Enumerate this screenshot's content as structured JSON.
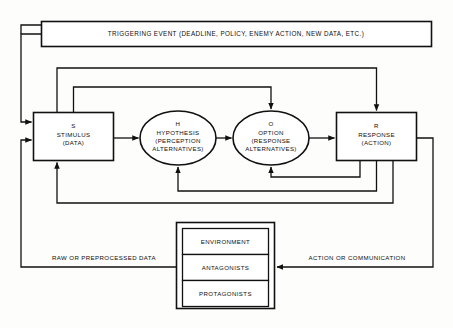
{
  "diagram": {
    "title_box": {
      "label": "TRIGGERING EVENT (DEADLINE, POLICY, ENEMY ACTION, NEW DATA, ETC.)"
    },
    "nodes": {
      "stimulus": {
        "letter": "S",
        "name": "STIMULUS",
        "qualifier": "(DATA)"
      },
      "hypothesis": {
        "letter": "H",
        "name": "HYPOTHESIS",
        "qualifier_line1": "(PERCEPTION",
        "qualifier_line2": "ALTERNATIVES)"
      },
      "option": {
        "letter": "O",
        "name": "OPTION",
        "qualifier_line1": "(RESPONSE",
        "qualifier_line2": "ALTERNATIVES)"
      },
      "response": {
        "letter": "R",
        "name": "RESPONSE",
        "qualifier": "(ACTION)"
      }
    },
    "world_stack": {
      "cells": [
        "ENVIRONMENT",
        "ANTAGONISTS",
        "PROTAGONISTS"
      ]
    },
    "edge_labels": {
      "left": "RAW OR PREPROCESSED DATA",
      "right": "ACTION OR COMMUNICATION"
    },
    "colors": {
      "stroke": "#111111",
      "fill": "#ffffff",
      "background": "#fdfdfb"
    }
  }
}
